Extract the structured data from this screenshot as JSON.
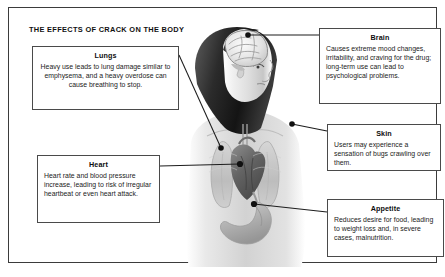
{
  "poster": {
    "title": "THE EFFECTS OF CRACK ON THE BODY",
    "border_color": "#3b3b3b",
    "background_color": "#ffffff",
    "illustration": "grayscale anatomical illustration of a woman in three-quarter profile showing brain, lungs, heart and stomach"
  },
  "callouts": [
    {
      "id": "lungs",
      "heading": "Lungs",
      "body": "Heavy use leads to lung damage similar to emphysema, and a heavy overdose can cause breathing to stop.",
      "target": "lungs"
    },
    {
      "id": "heart",
      "heading": "Heart",
      "body": "Heart rate and blood pressure increase, leading to risk of irregular heartbeat or even heart attack.",
      "target": "heart"
    },
    {
      "id": "brain",
      "heading": "Brain",
      "body": "Causes extreme mood changes, irritability, and craving for the drug; long-term use can lead to psychological problems.",
      "target": "brain"
    },
    {
      "id": "skin",
      "heading": "Skin",
      "body": "Users may experience a sensation of bugs crawling over them.",
      "target": "shoulder"
    },
    {
      "id": "appetite",
      "heading": "Appetite",
      "body": "Reduces desire for food, leading to weight loss and, in severe cases, malnutrition.",
      "target": "stomach"
    }
  ],
  "colors": {
    "line": "#1d1d1d",
    "box_border": "#4a4a4a",
    "text": "#1b1b1b",
    "heading": "#0d0d0d"
  }
}
